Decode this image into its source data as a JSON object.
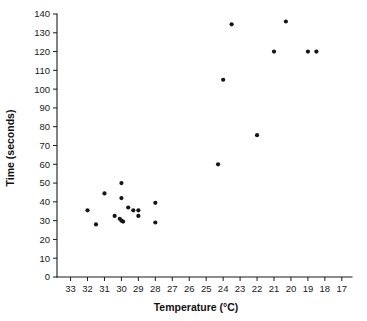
{
  "chart_data": {
    "type": "scatter",
    "title": "",
    "xlabel": "Temperature (°C)",
    "ylabel": "Time (seconds)",
    "xlim": [
      33.8,
      16.4
    ],
    "ylim": [
      0,
      140
    ],
    "x_reversed": true,
    "grid": false,
    "legend": null,
    "xticks": [
      33,
      32,
      31,
      30,
      29,
      28,
      27,
      26,
      25,
      24,
      23,
      22,
      21,
      20,
      19,
      18,
      17
    ],
    "yticks": [
      0,
      10,
      20,
      30,
      40,
      50,
      60,
      70,
      80,
      90,
      100,
      110,
      120,
      130,
      140
    ],
    "marker": "circle",
    "marker_color": "#161616",
    "points": [
      {
        "x": 32.0,
        "y": 35.5
      },
      {
        "x": 31.5,
        "y": 28.0
      },
      {
        "x": 31.0,
        "y": 44.5
      },
      {
        "x": 30.4,
        "y": 32.5
      },
      {
        "x": 30.0,
        "y": 50.0
      },
      {
        "x": 30.0,
        "y": 42.0
      },
      {
        "x": 30.1,
        "y": 31.0
      },
      {
        "x": 30.0,
        "y": 30.0
      },
      {
        "x": 29.9,
        "y": 29.5
      },
      {
        "x": 29.6,
        "y": 37.0
      },
      {
        "x": 29.3,
        "y": 35.5
      },
      {
        "x": 29.0,
        "y": 35.5
      },
      {
        "x": 29.0,
        "y": 32.5
      },
      {
        "x": 28.0,
        "y": 39.5
      },
      {
        "x": 28.0,
        "y": 29.0
      },
      {
        "x": 24.3,
        "y": 60.0
      },
      {
        "x": 24.0,
        "y": 105.0
      },
      {
        "x": 23.5,
        "y": 134.5
      },
      {
        "x": 22.0,
        "y": 75.5
      },
      {
        "x": 21.0,
        "y": 120.0
      },
      {
        "x": 20.3,
        "y": 136.0
      },
      {
        "x": 19.0,
        "y": 120.0
      },
      {
        "x": 18.5,
        "y": 120.0
      }
    ]
  },
  "axes": {
    "x_title": "Temperature (°C)",
    "y_title": "Time (seconds)"
  }
}
